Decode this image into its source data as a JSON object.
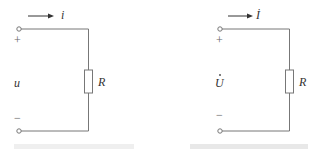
{
  "circuits": [
    {
      "id": "time-domain",
      "current_label": "i",
      "voltage_label": "u",
      "resistor_label": "R",
      "plus_sign": "+",
      "minus_sign": "−",
      "phasor": false
    },
    {
      "id": "phasor-domain",
      "current_label": "İ",
      "voltage_label": "U",
      "resistor_label": "R",
      "plus_sign": "+",
      "minus_sign": "−",
      "phasor": true
    }
  ],
  "colors": {
    "wire": "#777777",
    "arrow": "#333333",
    "text": "#333333"
  }
}
